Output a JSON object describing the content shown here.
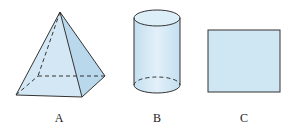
{
  "figures": [
    {
      "id": "A",
      "label": "A",
      "shape": "square-pyramid"
    },
    {
      "id": "B",
      "label": "B",
      "shape": "cylinder"
    },
    {
      "id": "C",
      "label": "C",
      "shape": "square"
    }
  ],
  "colors": {
    "fill": "#cfe6f3",
    "fill_dark": "#b9d8ec",
    "stroke": "#333333"
  }
}
